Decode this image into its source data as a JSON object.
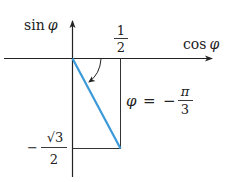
{
  "diagram": {
    "x_axis_label_fn": "cos",
    "x_axis_label_var": "φ",
    "y_axis_label_fn": "sin",
    "y_axis_label_var": "φ",
    "x_tick": {
      "numerator": "1",
      "denominator": "2"
    },
    "y_tick": {
      "sign": "−",
      "numerator": "√3",
      "denominator": "2"
    },
    "angle_label": {
      "var": "φ",
      "eq": "=",
      "sign": "−",
      "numerator": "π",
      "denominator": "3"
    },
    "colors": {
      "vector": "#3a9ad9",
      "axes": "#222222",
      "guides": "#333333"
    },
    "point": {
      "cos": 0.5,
      "sin": -0.866
    }
  }
}
